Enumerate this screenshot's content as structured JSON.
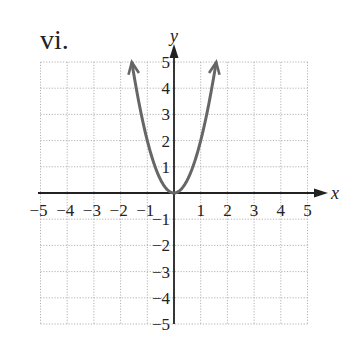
{
  "figure": {
    "label": "vi."
  },
  "chart_data": {
    "type": "line",
    "title": "vi.",
    "xlabel": "x",
    "ylabel": "y",
    "xlim": [
      -5,
      5
    ],
    "ylim": [
      -5,
      5
    ],
    "grid": true,
    "grid_style": "dotted",
    "x_ticks": [
      -5,
      -4,
      -3,
      -2,
      -1,
      1,
      2,
      3,
      4,
      5
    ],
    "y_ticks": [
      -5,
      -4,
      -3,
      -2,
      -1,
      1,
      2,
      3,
      4,
      5
    ],
    "series": [
      {
        "name": "y = 2x^2",
        "equation": "y = 2x^2",
        "color": "#666666",
        "arrows_at_ends": true,
        "x": [
          -1.58,
          -1.4,
          -1.2,
          -1.0,
          -0.8,
          -0.6,
          -0.4,
          -0.2,
          0,
          0.2,
          0.4,
          0.6,
          0.8,
          1.0,
          1.2,
          1.4,
          1.58
        ],
        "y": [
          5.0,
          3.92,
          2.88,
          2.0,
          1.28,
          0.72,
          0.32,
          0.08,
          0,
          0.08,
          0.32,
          0.72,
          1.28,
          2.0,
          2.88,
          3.92,
          5.0
        ]
      }
    ],
    "colors": {
      "axis": "#222222",
      "grid": "#aaaaaa",
      "curve": "#666666"
    }
  }
}
